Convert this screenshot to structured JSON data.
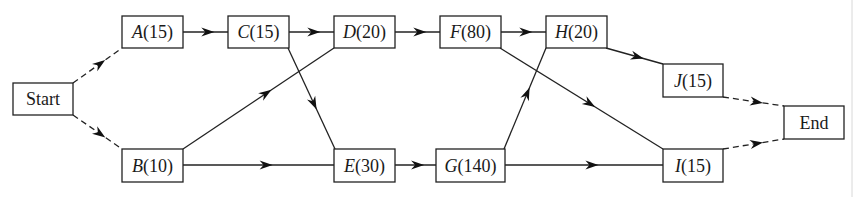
{
  "diagram": {
    "type": "activity-network",
    "nodes": [
      {
        "id": "start",
        "label": "Start",
        "letter": "",
        "duration": "",
        "x": 13,
        "y": 83,
        "w": 60,
        "h": 32
      },
      {
        "id": "A",
        "letter": "A",
        "duration": "(15)",
        "label": "A(15)",
        "x": 122,
        "y": 16,
        "w": 61,
        "h": 32
      },
      {
        "id": "B",
        "letter": "B",
        "duration": "(10)",
        "label": "B(10)",
        "x": 122,
        "y": 149,
        "w": 61,
        "h": 33
      },
      {
        "id": "C",
        "letter": "C",
        "duration": "(15)",
        "label": "C(15)",
        "x": 228,
        "y": 16,
        "w": 61,
        "h": 32
      },
      {
        "id": "D",
        "letter": "D",
        "duration": "(20)",
        "label": "D(20)",
        "x": 334,
        "y": 16,
        "w": 61,
        "h": 32
      },
      {
        "id": "E",
        "letter": "E",
        "duration": "(30)",
        "label": "E(30)",
        "x": 334,
        "y": 149,
        "w": 61,
        "h": 33
      },
      {
        "id": "F",
        "letter": "F",
        "duration": "(80)",
        "label": "F(80)",
        "x": 440,
        "y": 16,
        "w": 61,
        "h": 32
      },
      {
        "id": "G",
        "letter": "G",
        "duration": "(140)",
        "label": "G(140)",
        "x": 436,
        "y": 149,
        "w": 69,
        "h": 33
      },
      {
        "id": "H",
        "letter": "H",
        "duration": "(20)",
        "label": "H(20)",
        "x": 546,
        "y": 16,
        "w": 61,
        "h": 32
      },
      {
        "id": "J",
        "letter": "J",
        "duration": "(15)",
        "label": "J(15)",
        "x": 663,
        "y": 64,
        "w": 60,
        "h": 33
      },
      {
        "id": "I",
        "letter": "I",
        "duration": "(15)",
        "label": "I(15)",
        "x": 663,
        "y": 149,
        "w": 60,
        "h": 33
      },
      {
        "id": "end",
        "label": "End",
        "letter": "",
        "duration": "",
        "x": 784,
        "y": 106,
        "w": 60,
        "h": 33
      }
    ],
    "edges": [
      {
        "from": "start",
        "to": "A",
        "style": "dashed",
        "x1": 73,
        "y1": 83,
        "x2": 122,
        "y2": 48
      },
      {
        "from": "start",
        "to": "B",
        "style": "dashed",
        "x1": 73,
        "y1": 115,
        "x2": 122,
        "y2": 149
      },
      {
        "from": "A",
        "to": "C",
        "style": "solid",
        "x1": 183,
        "y1": 32,
        "x2": 228,
        "y2": 32
      },
      {
        "from": "C",
        "to": "D",
        "style": "solid",
        "x1": 289,
        "y1": 32,
        "x2": 334,
        "y2": 32
      },
      {
        "from": "C",
        "to": "E",
        "style": "solid",
        "x1": 288,
        "y1": 48,
        "x2": 335,
        "y2": 149
      },
      {
        "from": "B",
        "to": "D",
        "style": "solid",
        "x1": 183,
        "y1": 149,
        "x2": 334,
        "y2": 48
      },
      {
        "from": "B",
        "to": "E",
        "style": "solid",
        "x1": 183,
        "y1": 165,
        "x2": 334,
        "y2": 165
      },
      {
        "from": "D",
        "to": "F",
        "style": "solid",
        "x1": 395,
        "y1": 32,
        "x2": 440,
        "y2": 32
      },
      {
        "from": "E",
        "to": "G",
        "style": "solid",
        "x1": 395,
        "y1": 165,
        "x2": 436,
        "y2": 165
      },
      {
        "from": "F",
        "to": "H",
        "style": "solid",
        "x1": 501,
        "y1": 32,
        "x2": 546,
        "y2": 32
      },
      {
        "from": "F",
        "to": "I",
        "style": "solid",
        "x1": 500,
        "y1": 48,
        "x2": 663,
        "y2": 149
      },
      {
        "from": "G",
        "to": "H",
        "style": "solid",
        "x1": 504,
        "y1": 149,
        "x2": 546,
        "y2": 48
      },
      {
        "from": "G",
        "to": "I",
        "style": "solid",
        "x1": 505,
        "y1": 165,
        "x2": 663,
        "y2": 165
      },
      {
        "from": "H",
        "to": "J",
        "style": "solid",
        "x1": 606,
        "y1": 48,
        "x2": 663,
        "y2": 64
      },
      {
        "from": "J",
        "to": "end",
        "style": "dashed",
        "x1": 723,
        "y1": 97,
        "x2": 784,
        "y2": 106
      },
      {
        "from": "I",
        "to": "end",
        "style": "dashed",
        "x1": 723,
        "y1": 149,
        "x2": 784,
        "y2": 139
      }
    ],
    "colors": {
      "stroke": "#222222",
      "background": "#ffffff",
      "text": "#1a1a1a"
    }
  }
}
